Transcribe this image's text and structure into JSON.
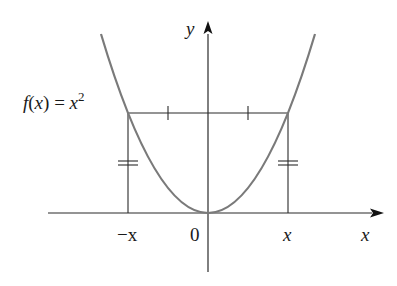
{
  "figure": {
    "function_label": "f(x) = x²",
    "function_label_parts": {
      "f": "f",
      "open": "(",
      "x": "x",
      "close": ")",
      "eq": " = ",
      "base": "x",
      "exp": "2"
    },
    "axis_labels": {
      "x": "x",
      "y": "y"
    },
    "tick_labels": {
      "neg_x": "−x",
      "origin": "0",
      "pos_x": "x"
    },
    "colors": {
      "curve": "#7a7a7a",
      "lines": "#2a2a2a",
      "text": "#1a1a1a"
    },
    "annotations": [
      "single tick marks bisect horizontal segment",
      "double tick marks show equal heights f(−x) = f(x)"
    ]
  }
}
